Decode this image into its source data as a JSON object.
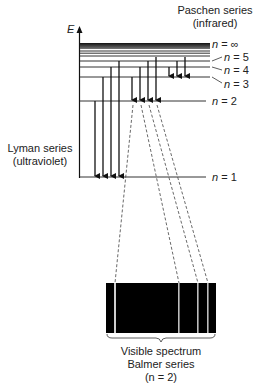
{
  "diagram": {
    "axis_label": "E",
    "levels": [
      {
        "label": "n = ∞",
        "n_sym": "n",
        "eq": " = ∞",
        "y": 44
      },
      {
        "label": "n = 5",
        "n_sym": "n",
        "eq": " = 5",
        "y": 61
      },
      {
        "label": "n = 4",
        "n_sym": "n",
        "eq": " = 4",
        "y": 67
      },
      {
        "label": "n = 3",
        "n_sym": "n",
        "eq": " = 3",
        "y": 77
      },
      {
        "label": "n = 2",
        "n_sym": "n",
        "eq": " = 2",
        "y": 101
      },
      {
        "label": "n = 1",
        "n_sym": "n",
        "eq": " = 1",
        "y": 177
      }
    ],
    "series": {
      "paschen": {
        "line1": "Paschen series",
        "line2": "(infrared)",
        "final_level": 3
      },
      "lyman": {
        "line1": "Lyman series",
        "line2": "(ultraviolet)",
        "final_level": 1
      },
      "balmer": {
        "line1": "Visible spectrum",
        "line2": "Balmer series",
        "line3": "(n = 2)",
        "final_level": 2
      }
    },
    "spectrum": {
      "background": "#000000",
      "line_color": "#cccccc",
      "line_count": 4
    },
    "colors": {
      "text": "#222222",
      "lines": "#333333",
      "arrows": "#111111"
    }
  }
}
